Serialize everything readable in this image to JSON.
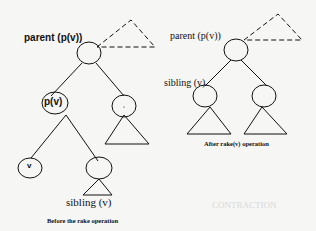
{
  "diagram": {
    "before": {
      "parent_label": "parent (p(v))",
      "node_pv_label": "p(v)",
      "node_v_label": "v",
      "sibling_label": "sibling (v)",
      "caption": "Before the rake operation"
    },
    "after": {
      "parent_label": "parent (p(v))",
      "sibling_label": "sibling (v)",
      "caption": "After rake(v) operation"
    },
    "background_text": "CONTRACTION"
  },
  "colors": {
    "ink": "#111111",
    "paper": "#f6f6f4",
    "ghost": "#d8d8d6"
  }
}
